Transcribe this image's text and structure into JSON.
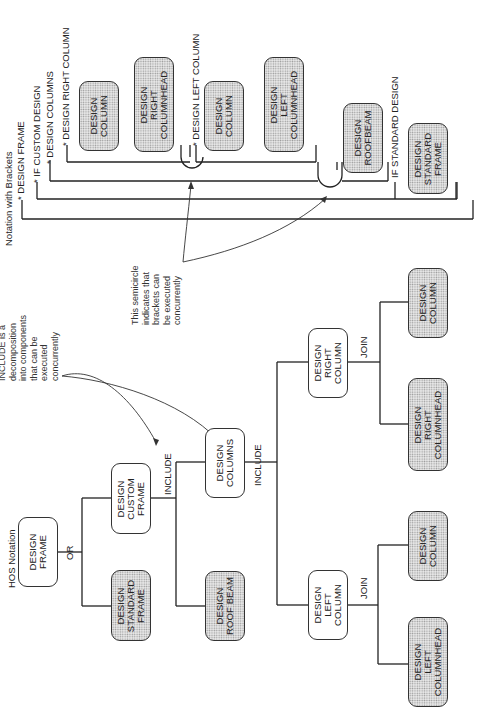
{
  "hos": {
    "title": "HOS Notation",
    "root": "DESIGN\nFRAME",
    "or_label": "OR",
    "standard_frame": "DESIGN\nSTANDARD\nFRAME",
    "custom_frame": "DESIGN\nCUSTOM\nFRAME",
    "include_label_1": "INCLUDE",
    "roof_beam": "DESIGN\nROOF BEAM",
    "columns": "DESIGN\nCOLUMNS",
    "include_label_2": "INCLUDE",
    "left_column": "DESIGN\nLEFT\nCOLUMN",
    "right_column": "DESIGN\nRIGHT\nCOLUMN",
    "join_label_left": "JOIN",
    "join_label_right": "JOIN",
    "left_columnhead": "DESIGN\nLEFT\nCOLUMNHEAD",
    "left_column_leaf": "DESIGN\nCOLUMN",
    "right_columnhead": "DESIGN\nRIGHT\nCOLUMNHEAD",
    "right_column_leaf": "DESIGN\nCOLUMN",
    "include_note": "INCLUDE is a\ndecomposition\ninto components\nthat can be\nexecuted\nconcurrently"
  },
  "brackets": {
    "title": "Notation with Brackets",
    "design_frame": "* DESIGN FRAME",
    "if_custom": "* IF CUSTOM DESIGN",
    "design_columns": "* DESIGN COLUMNS",
    "design_right_column": "* DESIGN RIGHT COLUMN",
    "design_left_column": "* DESIGN LEFT COLUMN",
    "if_standard": "IF STANDARD DESIGN",
    "box_column_1": "DESIGN\nCOLUMN",
    "box_right_columnhead": "DESIGN\nRIGHT\nCOLUMNHEAD",
    "box_column_2": "DESIGN\nCOLUMN",
    "box_left_columnhead": "DESIGN\nLEFT\nCOLUMNHEAD",
    "box_roofbeam": "DESIGN\nROOFBEAM",
    "box_standard_frame": "DESIGN\nSTANDARD\nFRAME",
    "semicircle_note": "This semicircle\nindicates that\nbrackets can\nbe executed\nconcurrently"
  }
}
